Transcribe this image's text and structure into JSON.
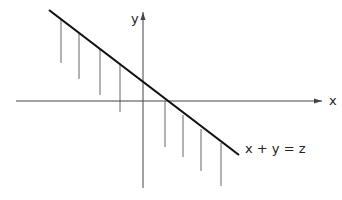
{
  "diagram": {
    "axis_labels": {
      "x": "x",
      "y": "y"
    },
    "line_label": "x + y = z",
    "colors": {
      "line": "#111111",
      "axis": "#444444",
      "stem": "#666666",
      "background": "#ffffff"
    },
    "line": {
      "x1": 49,
      "y1": 10,
      "x2": 239,
      "y2": 155
    },
    "x_axis": {
      "x1": 16,
      "y1": 101,
      "x2": 322,
      "y2": 101
    },
    "y_axis": {
      "x1": 143,
      "y1": 188,
      "x2": 143,
      "y2": 12
    },
    "stems": [
      {
        "x": 61,
        "y1": 19,
        "y2": 63
      },
      {
        "x": 79,
        "y1": 33,
        "y2": 79
      },
      {
        "x": 100,
        "y1": 49,
        "y2": 95
      },
      {
        "x": 120,
        "y1": 64,
        "y2": 112
      },
      {
        "x": 165,
        "y1": 101,
        "y2": 147
      },
      {
        "x": 183,
        "y1": 115,
        "y2": 157
      },
      {
        "x": 201,
        "y1": 129,
        "y2": 171
      },
      {
        "x": 221,
        "y1": 143,
        "y2": 186
      }
    ]
  }
}
